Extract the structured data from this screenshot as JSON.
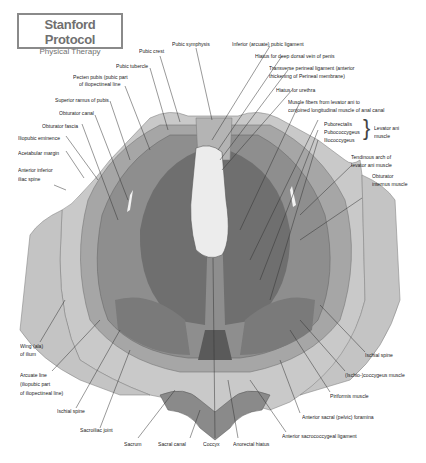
{
  "logo": {
    "title": "Stanford Protocol",
    "subtitle": "Physical Therapy"
  },
  "colors": {
    "outer_bone": "#c9c9c9",
    "mid_gray": "#a8a8a8",
    "muscle": "#8e8e8e",
    "dark_muscle": "#6f6f6f",
    "darkest": "#5a5a5a",
    "highlight": "#ececec",
    "line": "#333333"
  },
  "labels": {
    "pubic_crest": "Pubic crest",
    "pubic_symphysis": "Pubic symphysis",
    "inferior_pubic_ligament": "Inferior (arcuate) pubic ligament",
    "hiatus_dorsal_vein": "Hiatus for deep dorsal vein of penis",
    "transverse_perineal_1": "Transverse perineal ligament (anterior",
    "transverse_perineal_2": "thickening of Perineal membrane)",
    "hiatus_urethra": "Hiatus for urethra",
    "muscle_fibers_1": "Muscle fibers from levator ani to",
    "muscle_fibers_2": "conjoined longitudinal muscle of anal canal",
    "puborectalis": "Puborectalis",
    "pubococcygeus": "Pubococcygeus",
    "iliococcygeus": "Iliococcygeus",
    "levator_ani_1": "Levator ani",
    "levator_ani_2": "muscle",
    "tendinous_arch_1": "Tendinous arch of",
    "tendinous_arch_2": "levator ani muscle",
    "obturator_internus_1": "Obturator",
    "obturator_internus_2": "internus muscle",
    "pubic_tubercle": "Pubic tubercle",
    "pecten_pubis_1": "Pecten pubis (pubic part",
    "pecten_pubis_2": "of iliopectineal line",
    "superior_ramus": "Superior ramus of pubis",
    "obturator_canal": "Obturator canal",
    "obturator_fascia": "Obturator fascia",
    "iliopubic_eminence": "Iliopubic eminence",
    "acetabular_margin": "Acetabular margin",
    "anterior_inferior_iliac_1": "Anterior inferior",
    "anterior_inferior_iliac_2": "iliac spine",
    "wing_ilium_1": "Wing (ala)",
    "wing_ilium_2": "of ilium",
    "arcuate_line_1": "Arcuate line",
    "arcuate_line_2": "(iliopubic part",
    "arcuate_line_3": "of iliopectineal line)",
    "ischial_spine_left": "Ischial spine",
    "sacroiliac_joint": "Sacroiliac joint",
    "sacrum": "Sacrum",
    "sacral_canal": "Sacral canal",
    "coccyx": "Coccyx",
    "anorectal_hiatus": "Anorectal hiatus",
    "anterior_sacrococcygeal": "Anterior sacrococcygeal ligament",
    "anterior_sacral_foramina": "Anterior sacral (pelvic) foramina",
    "piriformis": "Piriformis muscle",
    "ischio_coccygeus": "(Ischio-)coccygeus muscle",
    "ischial_spine_right": "Ischial spine"
  }
}
